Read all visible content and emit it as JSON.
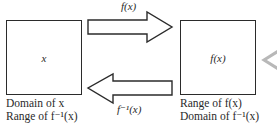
{
  "diagram": {
    "left_box": {
      "label": "x"
    },
    "right_box": {
      "label": "f(x)"
    },
    "forward_arrow": {
      "label": "f(x)",
      "direction": "right"
    },
    "inverse_arrow": {
      "label": "f⁻¹(x)",
      "direction": "left"
    },
    "left_caption": {
      "line1": "Domain of x",
      "line2": "Range of f⁻¹(x)"
    },
    "right_caption": {
      "line1": "Range of f(x)",
      "line2": "Domain of f⁻¹(x)"
    },
    "edge_chevron": {
      "icon": "chevron-left-icon",
      "color": "#b8b8b8"
    },
    "colors": {
      "stroke": "#2b2b2b",
      "background": "#ffffff"
    }
  }
}
